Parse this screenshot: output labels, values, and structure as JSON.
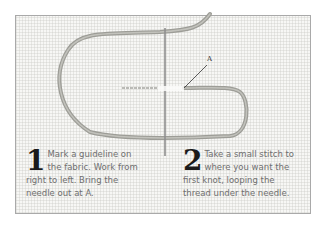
{
  "figure": {
    "label_point": "A",
    "steps": [
      {
        "number": "1",
        "text": "Mark a guideline on the fabric. Work from right to left. Bring the needle out at A."
      },
      {
        "number": "2",
        "text": "Take a small stitch to where you want the first knot, looping the thread under the needle."
      }
    ]
  }
}
